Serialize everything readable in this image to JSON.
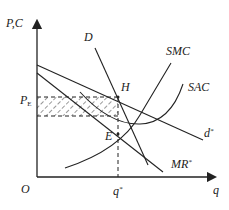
{
  "diagram": {
    "type": "economics-monopolistic-competition",
    "axes": {
      "y_label": "P,C",
      "x_label": "q",
      "origin_label": "O"
    },
    "curves": {
      "demand": "D",
      "smc": "SMC",
      "sac": "SAC",
      "d_star": "d",
      "d_star_sup": "*",
      "mr_star": "MR",
      "mr_star_sup": "*"
    },
    "points": {
      "H": "H",
      "E": "E"
    },
    "price_label": "P",
    "price_sub": "E",
    "quantity_label": "q",
    "quantity_sup": "*",
    "colors": {
      "line": "#222222",
      "background": "#ffffff"
    }
  }
}
